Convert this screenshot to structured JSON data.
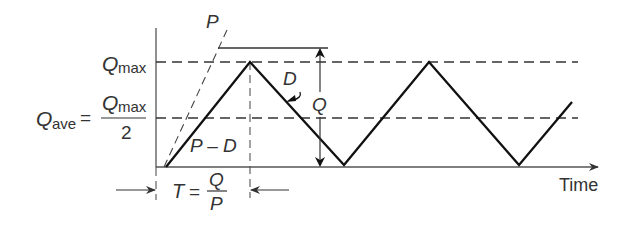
{
  "diagram": {
    "labels": {
      "p_line": "P",
      "d_line": "D",
      "q_arrow": "Q",
      "p_minus_d": "P – D",
      "time_axis": "Time",
      "qmax": {
        "main": "Q",
        "sub": "max"
      },
      "qave": {
        "lhs_main": "Q",
        "lhs_sub": "ave",
        "equals": "=",
        "num_main": "Q",
        "num_sub": "max",
        "den": "2"
      },
      "period": {
        "lhs": "T",
        "equals": "=",
        "num": "Q",
        "den": "P"
      }
    },
    "colors": {
      "line": "#111111",
      "axis": "#555555",
      "text": "#333333"
    }
  }
}
